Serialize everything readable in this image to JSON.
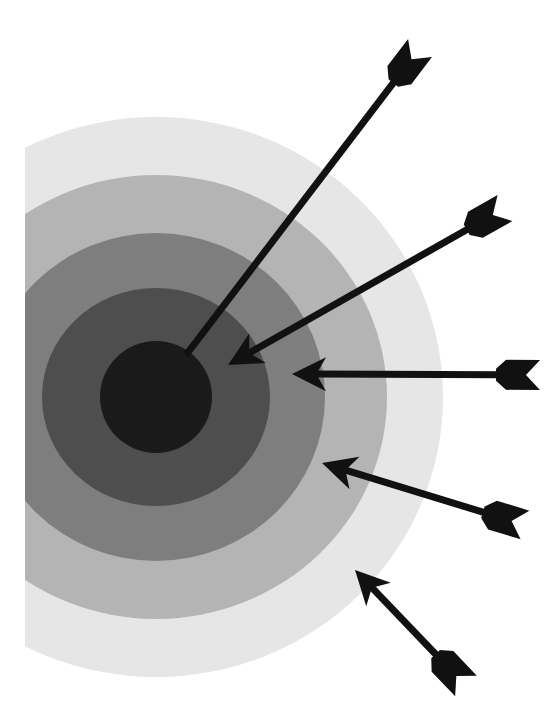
{
  "figure": {
    "caption": "Target with arrows",
    "background": "#ffffff",
    "target": {
      "center": [
        156,
        397
      ],
      "clip_left_x": 25,
      "rings": [
        {
          "name": "outer",
          "rx": 287,
          "ry": 280,
          "color": "#e6e6e6"
        },
        {
          "name": "ring-2",
          "rx": 231,
          "ry": 222,
          "color": "#b4b4b4"
        },
        {
          "name": "ring-3",
          "rx": 169,
          "ry": 164,
          "color": "#7e7e7e"
        },
        {
          "name": "ring-4",
          "rx": 114,
          "ry": 109,
          "color": "#4e4e4e"
        },
        {
          "name": "bullseye",
          "rx": 56,
          "ry": 56,
          "color": "#1a1a1a"
        }
      ]
    },
    "arrow_color": "#111111",
    "arrows": [
      {
        "name": "arrow-bullseye",
        "tip": [
          186,
          355
        ],
        "tail": [
          420,
          48
        ],
        "head": false
      },
      {
        "name": "arrow-ring-4",
        "tip": [
          228,
          365
        ],
        "tail": [
          505,
          208
        ],
        "head": true
      },
      {
        "name": "arrow-ring-3",
        "tip": [
          292,
          374
        ],
        "tail": [
          540,
          375
        ],
        "head": true
      },
      {
        "name": "arrow-ring-2",
        "tip": [
          322,
          463
        ],
        "tail": [
          525,
          525
        ],
        "head": true
      },
      {
        "name": "arrow-outer",
        "tip": [
          355,
          570
        ],
        "tail": [
          466,
          686
        ],
        "head": true
      }
    ]
  }
}
